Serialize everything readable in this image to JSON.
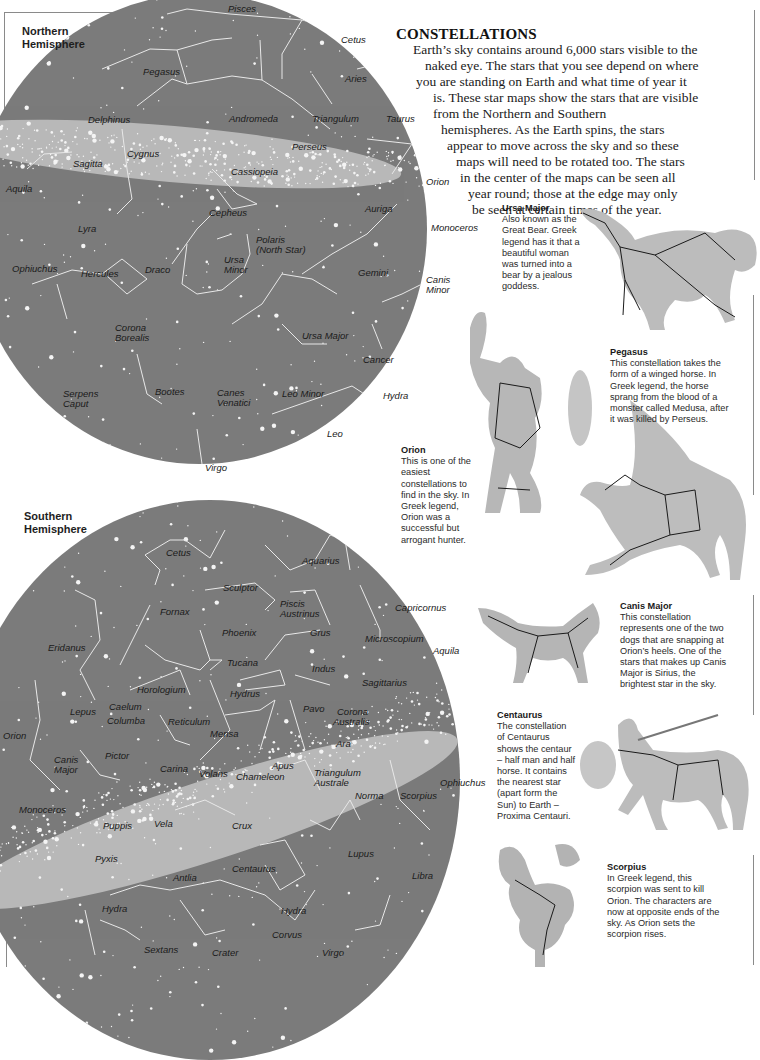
{
  "page": {
    "title": "CONSTELLATIONS",
    "intro_lines": [
      "Earth’s sky contains around 6,000 stars visible to the",
      "naked eye. The stars that you see depend on where",
      "you are standing on Earth and what time of year it",
      "is. These star maps show the stars that are visible",
      "from the Northern and Southern",
      "hemispheres. As the Earth spins, the stars",
      "appear to move across the sky and so these",
      "maps will need to be rotated too. The stars",
      "in the center of the maps can be seen all",
      "year round; those at the edge may only",
      "be seen at certain times of the year."
    ]
  },
  "colors": {
    "sky": "#7b7b7b",
    "star": "#f4f4f4",
    "label": "#1a1a1a",
    "illustration": "#b9b9b9"
  },
  "north_map": {
    "heading_line1": "Northern",
    "heading_line2": "Hemisphere",
    "labels": {
      "pisces": "Pisces",
      "cetus": "Cetus",
      "pegasus": "Pegasus",
      "aries": "Aries",
      "delphinus": "Delphinus",
      "andromeda": "Andromeda",
      "triangulum": "Triangulum",
      "taurus": "Taurus",
      "perseus": "Perseus",
      "cygnus": "Cygnus",
      "sagitta": "Sagitta",
      "cassiopeia": "Cassiopeia",
      "aquila": "Aquila",
      "orion": "Orion",
      "auriga": "Auriga",
      "cepheus": "Cepheus",
      "lyra": "Lyra",
      "monoceros": "Monoceros",
      "polaris1": "Polaris",
      "polaris2": "(North Star)",
      "ursa_minor1": "Ursa",
      "ursa_minor2": "Minor",
      "ophiuchus": "Ophiuchus",
      "hercules": "Hercules",
      "draco": "Draco",
      "gemini": "Gemini",
      "canis_minor1": "Canis",
      "canis_minor2": "Minor",
      "corona1": "Corona",
      "corona2": "Borealis",
      "ursa_major": "Ursa Major",
      "cancer": "Cancer",
      "serpens1": "Serpens",
      "serpens2": "Caput",
      "bootes": "Bootes",
      "canes1": "Canes",
      "canes2": "Venatici",
      "leo_minor": "Leo Minor",
      "hydra": "Hydra",
      "leo": "Leo",
      "virgo": "Virgo"
    }
  },
  "south_map": {
    "heading_line1": "Southern",
    "heading_line2": "Hemisphere",
    "labels": {
      "cetus": "Cetus",
      "aquarius": "Aquarius",
      "sculptor": "Sculptor",
      "piscis1": "Piscis",
      "piscis2": "Austrinus",
      "capricornus": "Capricornus",
      "fornax": "Fornax",
      "phoenix": "Phoenix",
      "grus": "Grus",
      "microscopium": "Microscopium",
      "eridanus": "Eridanus",
      "aquila": "Aquila",
      "tucana": "Tucana",
      "indus": "Indus",
      "sagittarius": "Sagittarius",
      "horologium": "Horologium",
      "hydrus": "Hydrus",
      "lepus": "Lepus",
      "caelum": "Caelum",
      "pavo": "Pavo",
      "corona1": "Corona",
      "corona2": "Australis",
      "columba": "Columba",
      "reticulum": "Reticulum",
      "orion": "Orion",
      "mensa": "Mensa",
      "ara": "Ara",
      "pictor": "Pictor",
      "apus": "Apus",
      "canis1": "Canis",
      "canis2": "Major",
      "carina": "Carina",
      "volans": "Volans",
      "chameleon": "Chameleon",
      "triangulum1": "Triangulum",
      "triangulum2": "Australe",
      "ophiuchus": "Ophiuchus",
      "norma": "Norma",
      "scorpius": "Scorpius",
      "monoceros": "Monoceros",
      "puppis": "Puppis",
      "vela": "Vela",
      "crux": "Crux",
      "lupus": "Lupus",
      "pyxis": "Pyxis",
      "centaurus": "Centaurus",
      "libra": "Libra",
      "antlia": "Antlia",
      "hydra_left": "Hydra",
      "hydra_right": "Hydra",
      "corvus": "Corvus",
      "sextans": "Sextans",
      "crater": "Crater",
      "virgo": "Virgo"
    }
  },
  "captions": {
    "ursa_major": {
      "title": "Ursa Major",
      "lines": [
        "Also known as the",
        "Great Bear. Greek",
        "legend has it that a",
        "beautiful woman",
        "was turned into a",
        "bear by a jealous",
        "goddess."
      ]
    },
    "pegasus": {
      "title": "Pegasus",
      "lines": [
        "This constellation takes the",
        "form of a winged horse. In",
        "Greek legend, the horse",
        "sprang from the blood of a",
        "monster called Medusa, after",
        "it was killed by Perseus."
      ]
    },
    "orion": {
      "title": "Orion",
      "lines": [
        "This is one of the",
        "easiest",
        "constellations to",
        "find in the sky. In",
        "Greek legend,",
        "Orion was a",
        "successful but",
        "arrogant hunter."
      ]
    },
    "canis_major": {
      "title": "Canis Major",
      "lines": [
        "This constellation",
        "represents one of the two",
        "dogs that are snapping at",
        "Orion’s heels. One of the",
        "stars that makes up Canis",
        "Major is Sirius, the",
        "brightest star in the sky."
      ]
    },
    "centaurus": {
      "title": "Centaurus",
      "lines": [
        "The constellation",
        "of Centaurus",
        "shows the centaur",
        "– half man and half",
        "horse. It contains",
        "the nearest star",
        "(apart form the",
        "Sun) to Earth –",
        "Proxima Centauri."
      ]
    },
    "scorpius": {
      "title": "Scorpius",
      "lines": [
        "In Greek legend, this",
        "scorpion was sent to kill",
        "Orion. The characters are",
        "now at opposite ends of the",
        "sky. As Orion sets the",
        "scorpion rises."
      ]
    }
  }
}
